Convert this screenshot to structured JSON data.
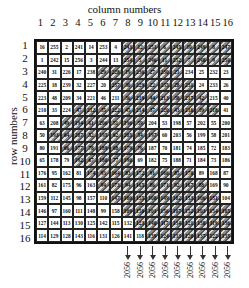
{
  "labels": {
    "column_title": "column numbers",
    "row_title": "row numbers"
  },
  "columns": [
    "1",
    "2",
    "3",
    "4",
    "5",
    "6",
    "7",
    "8",
    "9",
    "10",
    "11",
    "12",
    "13",
    "14",
    "15",
    "16"
  ],
  "rows": [
    "1",
    "2",
    "3",
    "4",
    "5",
    "6",
    "7",
    "8",
    "9",
    "10",
    "11",
    "12",
    "13",
    "14",
    "15",
    "16"
  ],
  "matrix": [
    [
      "16",
      "255",
      "2",
      "241",
      "14",
      "253",
      "4",
      "243",
      "12",
      "251",
      "6",
      "245",
      "10",
      "249",
      "8",
      "247"
    ],
    [
      "1",
      "242",
      "15",
      "256",
      "3",
      "244",
      "13",
      "254",
      "5",
      "246",
      "11",
      "252",
      "7",
      "248",
      "9",
      "250"
    ],
    [
      "240",
      "31",
      "226",
      "17",
      "238",
      "29",
      "228",
      "19",
      "236",
      "27",
      "230",
      "21",
      "234",
      "25",
      "232",
      "23"
    ],
    [
      "225",
      "18",
      "239",
      "32",
      "227",
      "20",
      "237",
      "30",
      "229",
      "22",
      "235",
      "28",
      "231",
      "24",
      "233",
      "26"
    ],
    [
      "223",
      "48",
      "209",
      "34",
      "221",
      "46",
      "211",
      "36",
      "219",
      "44",
      "213",
      "38",
      "217",
      "42",
      "215",
      "40"
    ],
    [
      "210",
      "33",
      "224",
      "47",
      "212",
      "35",
      "222",
      "45",
      "214",
      "37",
      "220",
      "43",
      "216",
      "39",
      "218",
      "41"
    ],
    [
      "63",
      "208",
      "49",
      "194",
      "61",
      "206",
      "51",
      "196",
      "59",
      "204",
      "53",
      "198",
      "57",
      "202",
      "55",
      "200"
    ],
    [
      "50",
      "193",
      "64",
      "207",
      "52",
      "195",
      "62",
      "205",
      "54",
      "197",
      "60",
      "203",
      "56",
      "199",
      "58",
      "201"
    ],
    [
      "80",
      "191",
      "66",
      "177",
      "78",
      "189",
      "68",
      "179",
      "76",
      "187",
      "70",
      "181",
      "74",
      "185",
      "72",
      "183"
    ],
    [
      "65",
      "178",
      "79",
      "192",
      "67",
      "180",
      "77",
      "190",
      "69",
      "182",
      "75",
      "188",
      "71",
      "184",
      "73",
      "186"
    ],
    [
      "176",
      "95",
      "162",
      "81",
      "174",
      "93",
      "164",
      "83",
      "172",
      "91",
      "166",
      "85",
      "170",
      "89",
      "168",
      "87"
    ],
    [
      "161",
      "82",
      "175",
      "96",
      "163",
      "94",
      "173",
      "94",
      "165",
      "86",
      "171",
      "92",
      "167",
      "88",
      "169",
      "90"
    ],
    [
      "159",
      "112",
      "145",
      "98",
      "157",
      "110",
      "147",
      "100",
      "155",
      "108",
      "149",
      "102",
      "153",
      "106",
      "151",
      "104"
    ],
    [
      "146",
      "97",
      "160",
      "111",
      "148",
      "99",
      "158",
      "109",
      "150",
      "101",
      "156",
      "107",
      "152",
      "103",
      "154",
      "105"
    ],
    [
      "127",
      "144",
      "113",
      "130",
      "125",
      "142",
      "115",
      "132",
      "123",
      "140",
      "117",
      "134",
      "121",
      "138",
      "119",
      "136"
    ],
    [
      "114",
      "129",
      "128",
      "143",
      "116",
      "131",
      "126",
      "141",
      "118",
      "139",
      "124",
      "133",
      "120",
      "137",
      "122",
      "135"
    ]
  ],
  "stripe_cells": "diagonal band cells are hatched",
  "column_sums": {
    "columns": [
      "8",
      "9",
      "10",
      "11",
      "12",
      "13",
      "14",
      "15",
      "16"
    ],
    "value": "2056"
  }
}
